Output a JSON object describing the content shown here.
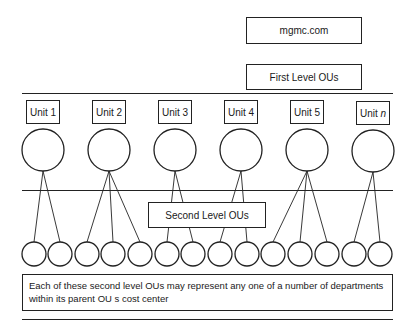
{
  "root": {
    "label": "mgmc.com"
  },
  "first_level": {
    "label": "First Level OUs"
  },
  "second_level": {
    "label": "Second Level OUs"
  },
  "units": [
    {
      "prefix": "Unit",
      "suffix": "1",
      "italic": false,
      "children": 2
    },
    {
      "prefix": "Unit",
      "suffix": "2",
      "italic": false,
      "children": 3
    },
    {
      "prefix": "Unit",
      "suffix": "3",
      "italic": false,
      "children": 2
    },
    {
      "prefix": "Unit",
      "suffix": "4",
      "italic": false,
      "children": 2
    },
    {
      "prefix": "Unit",
      "suffix": "5",
      "italic": false,
      "children": 3
    },
    {
      "prefix": "Unit",
      "suffix": "n",
      "italic": true,
      "children": 2
    }
  ],
  "note": {
    "line1": "Each of these second level OUs may represent any one of a number of departments",
    "line2": "within its parent OU s cost center"
  },
  "colors": {
    "stroke": "#222222",
    "background": "#ffffff"
  }
}
